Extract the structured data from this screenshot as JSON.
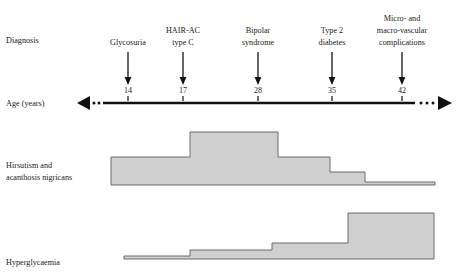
{
  "figure": {
    "background_color": "#ffffff",
    "ink_color": "#111111",
    "band_fill_color": "#cfcfcf",
    "band_stroke_color": "#6b6b6b"
  },
  "rows": {
    "diagnosis_label": "Diagnosis",
    "age_label": "Age (years)",
    "hirsutism_label_line1": "Hirsutism and",
    "hirsutism_label_line2": "acanthosis nigricans",
    "hyperglycaemia_label": "Hyperglycaemia"
  },
  "timeline": {
    "events": [
      {
        "age": "14",
        "x": 128,
        "label_lines": [
          "Glycosuria"
        ]
      },
      {
        "age": "17",
        "x": 183,
        "label_lines": [
          "HAIR-AC",
          "type C"
        ]
      },
      {
        "age": "28",
        "x": 258,
        "label_lines": [
          "Bipolar",
          "syndrome"
        ]
      },
      {
        "age": "35",
        "x": 332,
        "label_lines": [
          "Type 2",
          "diabetes"
        ]
      },
      {
        "age": "42",
        "x": 402,
        "label_lines": [
          "Micro- and",
          "macro-vascular",
          "complications"
        ]
      }
    ],
    "axis": {
      "y": 103,
      "solid_start_x": 103,
      "solid_end_x": 415,
      "left_arrow_tip_x": 77,
      "right_arrow_tip_x": 452,
      "left_dots_x": [
        94,
        99
      ],
      "right_dots_x": [
        421,
        427,
        433
      ]
    }
  },
  "chart_data": {
    "type": "area",
    "title": "",
    "xlabel": "Age (years)",
    "ylabel": "",
    "xlim": [
      0,
      459
    ],
    "grid": false,
    "legend": "none",
    "series": [
      {
        "name": "Hirsutism and acanthosis nigricans",
        "baseline_y": 185,
        "steps": [
          {
            "x_start": 111,
            "x_end": 190,
            "top_y": 157
          },
          {
            "x_start": 190,
            "x_end": 278,
            "top_y": 132
          },
          {
            "x_start": 278,
            "x_end": 330,
            "top_y": 157
          },
          {
            "x_start": 330,
            "x_end": 365,
            "top_y": 172
          },
          {
            "x_start": 365,
            "x_end": 435,
            "top_y": 182
          }
        ]
      },
      {
        "name": "Hyperglycaemia",
        "baseline_y": 259,
        "steps": [
          {
            "x_start": 124,
            "x_end": 190,
            "top_y": 256
          },
          {
            "x_start": 190,
            "x_end": 272,
            "top_y": 250
          },
          {
            "x_start": 272,
            "x_end": 348,
            "top_y": 243
          },
          {
            "x_start": 348,
            "x_end": 434,
            "top_y": 213
          }
        ]
      }
    ]
  }
}
